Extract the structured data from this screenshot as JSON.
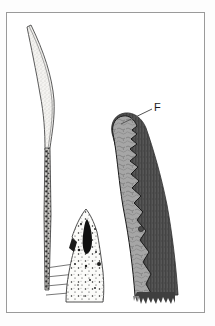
{
  "figure": {
    "kind": "scientific-illustration",
    "medium": "scanned line drawing with halftone shading",
    "background_color": "#ffffff",
    "page_color": "#fdfdfd",
    "frame": {
      "visible": true,
      "border_color": "#9a9a9a",
      "border_width_px": 1,
      "x": 6,
      "y": 12,
      "width": 199,
      "height": 301
    },
    "labels": [
      {
        "id": "F",
        "text": "F",
        "x": 154,
        "y": 102,
        "font_size_px": 11,
        "color": "#1a1a1a",
        "leader_line": {
          "from_x": 152,
          "from_y": 110,
          "to_x": 120,
          "to_y": 124,
          "color": "#555555",
          "width_px": 1
        }
      }
    ],
    "specimens": [
      {
        "name": "left-specimen",
        "description": "slender elongated curved structure, pale stippled upper portion tapering into a dark mottled lower shaft",
        "fill_light": "#f2f1ee",
        "stipple_color": "#8d8d8d",
        "outline_color": "#4a4a4a",
        "dark_shaft_color": "#3a3a3a"
      },
      {
        "name": "left-specimen-base",
        "description": "peaked triangular basal mass with large black elongated inclusion and scattered dark granules",
        "fill": "#fbfbfa",
        "outline_color": "#3c3c3c",
        "inclusion_color": "#111111",
        "granule_color": "#1c1c1c"
      },
      {
        "name": "ladder-striations",
        "description": "four short horizontal cross-lines at the lower left of the shaft",
        "line_color": "#555555",
        "count": 4
      },
      {
        "name": "right-specimen",
        "description": "thick curved club-shaped structure with rounded apex; dark grey outer cortical band and lighter grey inner medullary zone separated by a wavy scalloped black boundary; ragged torn basal edge",
        "outer_band_color": "#4e4e4e",
        "inner_zone_color": "#a3a3a3",
        "boundary_color": "#1a1a1a",
        "texture_color": "#7d7d7d",
        "label_ref": "F"
      }
    ]
  }
}
